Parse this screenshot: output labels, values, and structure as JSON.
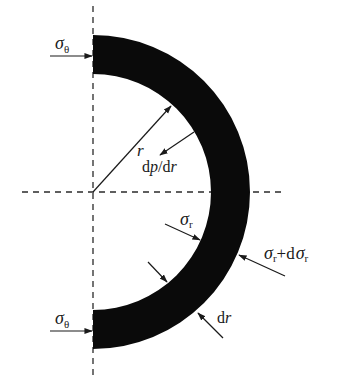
{
  "diagram": {
    "type": "half-annulus stress element",
    "colors": {
      "ring": "#0a0a0a",
      "line": "#1a1a1a",
      "dashed": "#2a2a2a",
      "background": "#ffffff"
    },
    "geometry": {
      "center": [
        93,
        192
      ],
      "inner_radius": 118,
      "outer_radius": 157
    },
    "labels": {
      "sigma_theta_top": {
        "symbol": "σ",
        "subscript": "θ"
      },
      "sigma_theta_bottom": {
        "symbol": "σ",
        "subscript": "θ"
      },
      "radius": "r",
      "pressure_gradient": {
        "d1": "d",
        "p": "p",
        "slash": "/d",
        "r": "r"
      },
      "sigma_r": {
        "symbol": "σ",
        "subscript": "r"
      },
      "sigma_r_plus_d": {
        "symbol": "σ",
        "subscript": "r",
        "plus": "+d",
        "symbol2": "σ",
        "subscript2": "r"
      },
      "thickness": {
        "d": "d",
        "r": "r"
      }
    }
  }
}
